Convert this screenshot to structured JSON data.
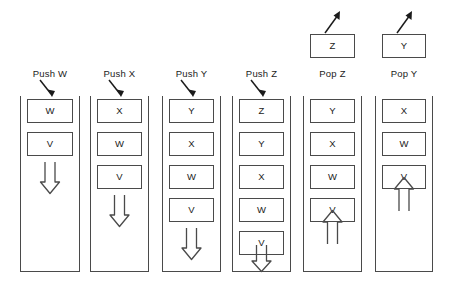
{
  "diagram": {
    "background_color": "#ffffff",
    "line_color": "#4a4a4a",
    "text_color": "#1b1b1b"
  },
  "columns": [
    {
      "caption": "Push W",
      "operation": "push",
      "pointer_arrow": "arrow-down-right-icon",
      "cells": [
        "W",
        "V"
      ],
      "stack_arrow": "double-arrow-down-icon",
      "popped_cell": null,
      "popped_arrow": null
    },
    {
      "caption": "Push X",
      "operation": "push",
      "pointer_arrow": "arrow-down-right-icon",
      "cells": [
        "X",
        "W",
        "V"
      ],
      "stack_arrow": "double-arrow-down-icon",
      "popped_cell": null,
      "popped_arrow": null
    },
    {
      "caption": "Push Y",
      "operation": "push",
      "pointer_arrow": "arrow-down-right-icon",
      "cells": [
        "Y",
        "X",
        "W",
        "V"
      ],
      "stack_arrow": "double-arrow-down-icon",
      "popped_cell": null,
      "popped_arrow": null
    },
    {
      "caption": "Push Z",
      "operation": "push",
      "pointer_arrow": "arrow-down-right-icon",
      "cells": [
        "Z",
        "Y",
        "X",
        "W",
        "V"
      ],
      "stack_arrow": "double-arrow-down-icon",
      "popped_cell": null,
      "popped_arrow": null
    },
    {
      "caption": "Pop Z",
      "operation": "pop",
      "pointer_arrow": null,
      "cells": [
        "Y",
        "X",
        "W",
        "V"
      ],
      "stack_arrow": "double-arrow-up-icon",
      "popped_cell": "Z",
      "popped_arrow": "arrow-up-right-icon"
    },
    {
      "caption": "Pop Y",
      "operation": "pop",
      "pointer_arrow": null,
      "cells": [
        "X",
        "W",
        "V"
      ],
      "stack_arrow": "double-arrow-up-icon",
      "popped_cell": "Y",
      "popped_arrow": "arrow-up-right-icon"
    }
  ]
}
